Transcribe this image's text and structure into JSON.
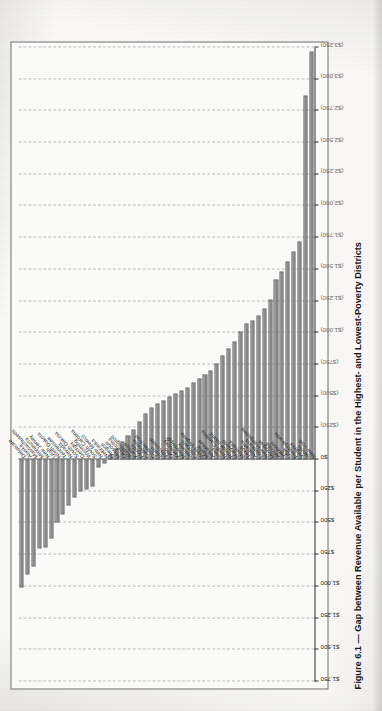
{
  "document": {
    "kind": "scanned-book-page",
    "caption": "Figure 6.1 — Gap between Revenue Available per Student in the Highest- and Lowest-Poverty Districts"
  },
  "chart_data": {
    "type": "bar",
    "orientation": "horizontal",
    "title": "Gap between Revenue Available per Student in the Highest- and Lowest-Poverty Districts",
    "xlabel": "",
    "ylabel": "",
    "xlim": [
      1750,
      -3250
    ],
    "grid": true,
    "legend": "none",
    "axis_tick_labels": [
      "$1,750",
      "$1,500",
      "$1,250",
      "$1,000",
      "$750",
      "$500",
      "$250",
      "$0",
      "($250)",
      "($500)",
      "($750)",
      "($1,000)",
      "($1,250)",
      "($1,500)",
      "($1,750)",
      "($2,000)",
      "($2,250)",
      "($2,500)",
      "($2,750)",
      "($3,000)",
      "($3,250)"
    ],
    "axis_tick_values": [
      1750,
      1500,
      1250,
      1000,
      750,
      500,
      250,
      0,
      -250,
      -500,
      -750,
      -1000,
      -1250,
      -1500,
      -1750,
      -2000,
      -2250,
      -2500,
      -2750,
      -3000,
      -3250
    ],
    "categories": [
      "Delaware",
      "Alaska",
      "Massachusetts",
      "Minnesota",
      "New Jersey",
      "Utah",
      "North Dakota",
      "Tennessee",
      "Nevada",
      "South Dakota",
      "Georgia",
      "Wyoming",
      "South Carolina",
      "New Mexico",
      "Nebraska",
      "Oregon",
      "Missouri",
      "Oklahoma",
      "Washington",
      "Kansas",
      "Florida",
      "California",
      "Connecticut",
      "Idaho",
      "Wisconsin",
      "Ohio",
      "Kentucky",
      "Mississippi",
      "Indiana",
      "Colorado",
      "West Virginia",
      "Maine",
      "Arkansas",
      "Iowa",
      "North Carolina",
      "Rhode Island",
      "Maryland",
      "Montana",
      "Texas",
      "Alabama",
      "Louisiana",
      "New Hampshire",
      "Michigan",
      "Arizona",
      "Vermont",
      "USA",
      "Pennsylvania",
      "Virginia",
      "Illinois",
      "New York"
    ],
    "values": [
      1010,
      905,
      840,
      700,
      690,
      620,
      500,
      430,
      360,
      300,
      255,
      235,
      215,
      60,
      30,
      -40,
      -90,
      -140,
      -190,
      -240,
      -300,
      -360,
      -410,
      -440,
      -470,
      -500,
      -520,
      -545,
      -570,
      -610,
      -640,
      -670,
      -700,
      -760,
      -820,
      -880,
      -930,
      -1010,
      -1070,
      -1100,
      -1140,
      -1190,
      -1260,
      -1420,
      -1480,
      -1560,
      -1640,
      -1720,
      -2870,
      -3220
    ]
  }
}
